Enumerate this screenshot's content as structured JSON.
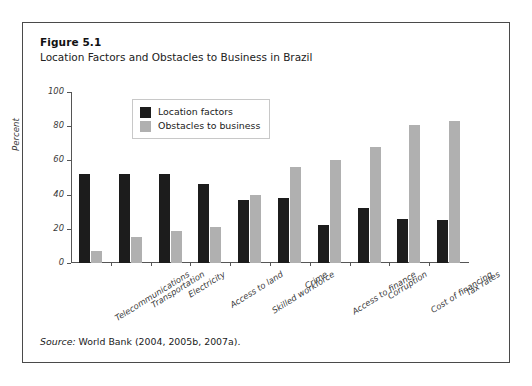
{
  "figure": {
    "number": "Figure 5.1",
    "title": "Location Factors and Obstacles to Business in Brazil",
    "source_label": "Source:",
    "source_text": " World Bank (2004, 2005b, 2007a)."
  },
  "colors": {
    "location_factors": "#1c1c1c",
    "obstacles_to_business": "#b0b0b0",
    "frame_border": "#4a4a4a",
    "axis": "#555555",
    "legend_border": "#c8c8c8"
  },
  "chart_data": {
    "type": "bar",
    "title": "Location Factors and Obstacles to Business in Brazil",
    "xlabel": "",
    "ylabel": "Percent",
    "ylim": [
      0,
      100
    ],
    "yticks": [
      0,
      20,
      40,
      60,
      80,
      100
    ],
    "grid": false,
    "legend_position": "upper-left-inside",
    "categories": [
      "Telecommunications",
      "Transportation",
      "Electricity",
      "Access to land",
      "Skilled workforce",
      "Crime",
      "Access to finance",
      "Corruption",
      "Cost of financing",
      "Tax rates"
    ],
    "series": [
      {
        "name": "Location factors",
        "color": "#1c1c1c",
        "values": [
          52,
          52,
          52,
          46,
          37,
          38,
          22,
          32,
          26,
          25
        ]
      },
      {
        "name": "Obstacles to business",
        "color": "#b0b0b0",
        "values": [
          7,
          15,
          19,
          21,
          40,
          56,
          60,
          68,
          81,
          83
        ]
      }
    ]
  }
}
